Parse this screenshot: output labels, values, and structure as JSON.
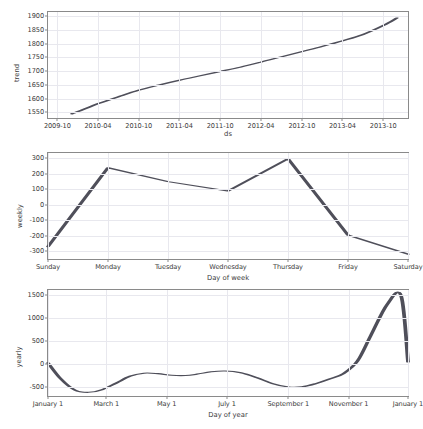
{
  "chart_data": [
    {
      "type": "line",
      "title": "",
      "panel": "trend",
      "xlabel": "ds",
      "ylabel": "trend",
      "ylim": [
        1530,
        1915
      ],
      "yticks": [
        1550,
        1600,
        1650,
        1700,
        1750,
        1800,
        1850,
        1900
      ],
      "xticks": [
        "2009-10",
        "2010-04",
        "2010-10",
        "2011-04",
        "2011-10",
        "2012-04",
        "2012-10",
        "2013-04",
        "2013-10"
      ],
      "xlim": [
        "2009-08-20",
        "2014-01-20"
      ],
      "grid": true,
      "x": [
        "2009-12-05",
        "2010-02-01",
        "2010-04-01",
        "2010-07-01",
        "2010-10-01",
        "2011-01-01",
        "2011-04-01",
        "2011-07-01",
        "2011-10-01",
        "2012-01-01",
        "2012-04-01",
        "2012-07-01",
        "2012-10-01",
        "2013-01-01",
        "2013-04-01",
        "2013-07-01",
        "2013-10-01",
        "2013-12-01"
      ],
      "values": [
        1545,
        1563,
        1582,
        1607,
        1631,
        1650,
        1667,
        1683,
        1699,
        1715,
        1733,
        1752,
        1771,
        1790,
        1810,
        1833,
        1866,
        1893
      ]
    },
    {
      "type": "line",
      "title": "",
      "panel": "weekly",
      "xlabel": "Day of week",
      "ylabel": "weekly",
      "ylim": [
        -350,
        335
      ],
      "yticks": [
        -300,
        -200,
        -100,
        0,
        100,
        200,
        300
      ],
      "categories": [
        "Sunday",
        "Monday",
        "Tuesday",
        "Wednesday",
        "Thursday",
        "Friday",
        "Saturday"
      ],
      "grid": true,
      "values": [
        -270,
        240,
        150,
        90,
        298,
        -195,
        -318
      ]
    },
    {
      "type": "line",
      "title": "",
      "panel": "yearly",
      "xlabel": "Day of year",
      "ylabel": "yearly",
      "ylim": [
        -700,
        1600
      ],
      "yticks": [
        -500,
        0,
        500,
        1000,
        1500
      ],
      "xticks": [
        "January 1",
        "March 1",
        "May 1",
        "July 1",
        "September 1",
        "November 1",
        "January 1"
      ],
      "grid": true,
      "x_days": [
        1,
        14,
        28,
        42,
        56,
        70,
        84,
        98,
        112,
        126,
        140,
        152,
        166,
        180,
        196,
        212,
        228,
        244,
        258,
        272,
        286,
        300,
        314,
        328,
        344,
        358,
        365
      ],
      "values": [
        20,
        -330,
        -570,
        -620,
        -560,
        -420,
        -270,
        -205,
        -215,
        -250,
        -255,
        -225,
        -175,
        -158,
        -195,
        -300,
        -430,
        -505,
        -500,
        -430,
        -330,
        -210,
        60,
        640,
        1290,
        1475,
        40
      ]
    }
  ],
  "panels": {
    "trend": {
      "ylabel": "trend",
      "xlabel": "ds",
      "yticks": [
        "1550",
        "1600",
        "1650",
        "1700",
        "1750",
        "1800",
        "1850",
        "1900"
      ],
      "xticks": [
        "2009-10",
        "2010-04",
        "2010-10",
        "2011-04",
        "2011-10",
        "2012-04",
        "2012-10",
        "2013-04",
        "2013-10"
      ]
    },
    "weekly": {
      "ylabel": "weekly",
      "xlabel": "Day of week",
      "yticks": [
        "-300",
        "-200",
        "-100",
        "0",
        "100",
        "200",
        "300"
      ],
      "xticks": [
        "Sunday",
        "Monday",
        "Tuesday",
        "Wednesday",
        "Thursday",
        "Friday",
        "Saturday"
      ]
    },
    "yearly": {
      "ylabel": "yearly",
      "xlabel": "Day of year",
      "yticks": [
        "-500",
        "0",
        "500",
        "1000",
        "1500"
      ],
      "xticks": [
        "January 1",
        "March 1",
        "May 1",
        "July 1",
        "September 1",
        "November 1",
        "January 1"
      ]
    }
  },
  "style": {
    "line_color": "#4f4f5a",
    "grid_color": "#e8e8ee",
    "axis_color": "#8a8a8a",
    "text_color": "#3b3b3b",
    "background": "#ffffff"
  }
}
